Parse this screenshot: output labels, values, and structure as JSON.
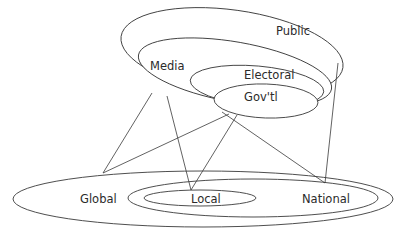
{
  "diagram": {
    "top_group": {
      "ellipses": [
        {
          "id": "public",
          "label": "Public"
        },
        {
          "id": "media",
          "label": "Media"
        },
        {
          "id": "electoral",
          "label": "Electoral"
        },
        {
          "id": "govtl",
          "label": "Gov'tl"
        }
      ]
    },
    "bottom_group": {
      "ellipses": [
        {
          "id": "global",
          "label": "Global"
        },
        {
          "id": "national",
          "label": "National"
        },
        {
          "id": "local",
          "label": "Local"
        }
      ]
    },
    "links": [
      {
        "from": "Media",
        "to": "Global"
      },
      {
        "from": "Media",
        "to": "Local"
      },
      {
        "from": "Media",
        "to": "National"
      },
      {
        "from": "Gov'tl",
        "to": "Global"
      },
      {
        "from": "Gov'tl",
        "to": "Local"
      },
      {
        "from": "Public",
        "to": "National"
      }
    ],
    "stroke_color": "#3a3a3a",
    "background": "#ffffff"
  }
}
